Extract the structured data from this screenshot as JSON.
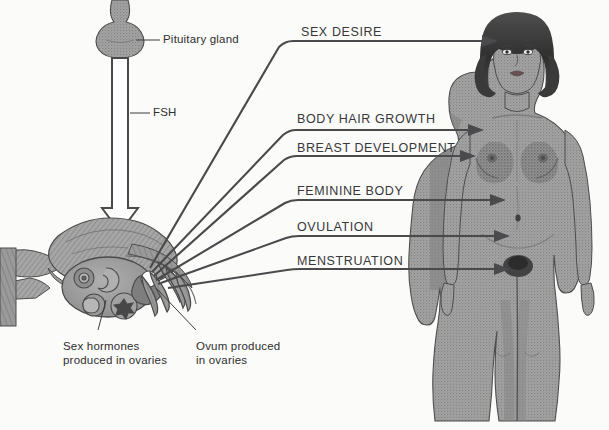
{
  "diagram": {
    "title_visible": false,
    "background_color": "#fbfbf9",
    "ink_color": "#4a4a4d",
    "body_tone": "#9c9c9c"
  },
  "anatomy_labels": {
    "pituitary": "Pituitary gland",
    "fsh": "FSH",
    "sex_hormones": "Sex hormones\nproduced in ovaries",
    "sex_hormones_line1": "Sex hormones",
    "sex_hormones_line2": "produced in ovaries",
    "ovum_line1": "Ovum produced",
    "ovum_line2": "in ovaries"
  },
  "effects": [
    {
      "label": "SEX DESIRE",
      "target": "head"
    },
    {
      "label": "BODY HAIR GROWTH",
      "target": "shoulder-armpit"
    },
    {
      "label": "BREAST DEVELOPMENT",
      "target": "breast"
    },
    {
      "label": "FEMININE BODY",
      "target": "waist-hip"
    },
    {
      "label": "OVULATION",
      "target": "lower-abdomen"
    },
    {
      "label": "MENSTRUATION",
      "target": "pubis"
    }
  ],
  "figure": {
    "name": "adult female body, front view",
    "hair": "dark bobbed hair"
  },
  "organ": {
    "name": "uterus with fallopian tubes and ovary cross-section",
    "ovum_color": "#ffffff",
    "follicle_count": 6
  }
}
